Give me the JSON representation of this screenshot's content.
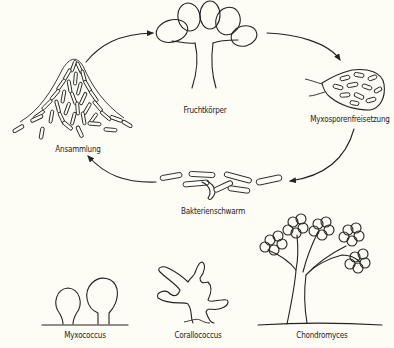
{
  "diagram": {
    "type": "life-cycle",
    "background": "#fdfdf6",
    "line_color": "#222222",
    "cycle_stages": [
      {
        "id": "fruchtkoerper",
        "label": "Fruchtkörper"
      },
      {
        "id": "myxosporenfreisetzung",
        "label": "Myxosporenfreisetzung"
      },
      {
        "id": "bakterienschwarm",
        "label": "Bakterienschwarm"
      },
      {
        "id": "ansammlung",
        "label": "Ansammlung"
      }
    ],
    "arrows": [
      {
        "from": "ansammlung",
        "to": "fruchtkoerper"
      },
      {
        "from": "fruchtkoerper",
        "to": "myxosporenfreisetzung"
      },
      {
        "from": "myxosporenfreisetzung",
        "to": "bakterienschwarm"
      },
      {
        "from": "bakterienschwarm",
        "to": "ansammlung"
      }
    ],
    "examples": [
      {
        "id": "myxococcus",
        "label": "Myxococcus"
      },
      {
        "id": "corallococcus",
        "label": "Corallococcus"
      },
      {
        "id": "chondromyces",
        "label": "Chondromyces"
      }
    ]
  }
}
